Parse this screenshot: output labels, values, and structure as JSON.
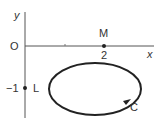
{
  "diagram": {
    "axes": {
      "x_label": "x",
      "y_label": "y",
      "origin_label": "O"
    },
    "points": {
      "M": {
        "label": "M",
        "tick_label": "2"
      },
      "L": {
        "label": "L",
        "tick_label": "−1"
      }
    },
    "curve": {
      "label": "C",
      "shape": "ellipse",
      "orientation": "arrow on lower-right"
    },
    "colors": {
      "stroke": "#222222",
      "axis": "#555555",
      "text": "#333333"
    }
  }
}
